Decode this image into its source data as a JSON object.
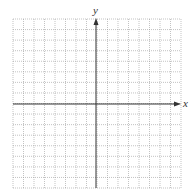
{
  "diagram": {
    "type": "coordinate-grid",
    "x_axis_label": "x",
    "y_axis_label": "y",
    "grid": {
      "columns": 16,
      "rows": 16,
      "columns_left_of_y_axis": 8,
      "rows_above_x_axis": 8,
      "line_style": "dotted"
    },
    "colors": {
      "grid": "#9a9a9a",
      "axis": "#333333",
      "background": "#ffffff"
    }
  }
}
